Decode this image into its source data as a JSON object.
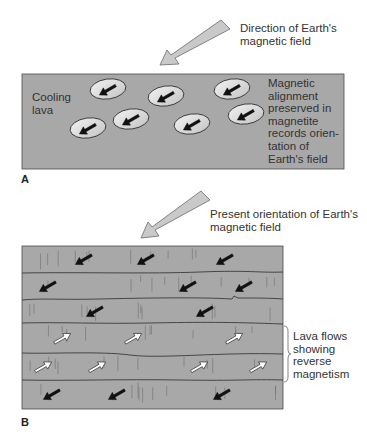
{
  "panel_a": {
    "letter": "A",
    "field_label": "Direction of Earth's\nmagnetic field",
    "lava_label": "Cooling\nlava",
    "magnetite_label": "Magnetic\nalignment\npreserved in\nmagnetite\nrecords orien-\ntation of\nEarth's field",
    "grains": [
      {
        "cx": 108,
        "cy": 89
      },
      {
        "cx": 166,
        "cy": 96
      },
      {
        "cx": 232,
        "cy": 89
      },
      {
        "cx": 88,
        "cy": 128
      },
      {
        "cx": 131,
        "cy": 119
      },
      {
        "cx": 192,
        "cy": 124
      },
      {
        "cx": 246,
        "cy": 114
      }
    ]
  },
  "panel_b": {
    "letter": "B",
    "field_label": "Present orientation of Earth's\nmagnetic field",
    "reverse_label": "Lava flows\nshowing\nreverse\nmagnetism",
    "layers": [
      {
        "polarity": "normal",
        "arrows_x": [
          84,
          146,
          225
        ]
      },
      {
        "polarity": "normal",
        "arrows_x": [
          48,
          188,
          244
        ]
      },
      {
        "polarity": "normal",
        "arrows_x": [
          95,
          205
        ]
      },
      {
        "polarity": "reverse",
        "arrows_x": [
          62,
          133,
          234
        ]
      },
      {
        "polarity": "reverse",
        "arrows_x": [
          43,
          97,
          199,
          258
        ]
      },
      {
        "polarity": "normal",
        "arrows_x": [
          52,
          117,
          222
        ]
      }
    ]
  },
  "colors": {
    "lava_fill": "#a8a8a8",
    "outline": "#3a3a3a",
    "big_arrow_fill": "#c9c9c9",
    "grain_fill": "#dcdcdc",
    "normal_arrow": "#111111",
    "reverse_arrow": "#ffffff"
  }
}
